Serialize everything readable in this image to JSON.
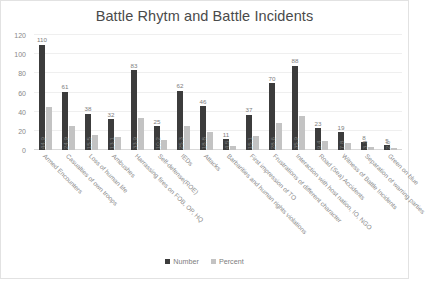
{
  "chart_data": {
    "type": "bar",
    "title": "Battle Rhytm and Battle Incidents",
    "xlabel": "",
    "ylabel": "",
    "ylim": [
      0,
      120
    ],
    "yticks": [
      0,
      20,
      40,
      60,
      80,
      100,
      120
    ],
    "grid": true,
    "legend_position": "bottom",
    "categories": [
      "Armed Encounters",
      "Casualties of own troops",
      "Loss of human life",
      "Ambushes",
      "Harrassing fires on FOB, OP, HQ",
      "Self-defense(ROE)",
      "IEDs",
      "Attacks",
      "Barbarities and human rights violations",
      "First impression of TO",
      "Frustrations of different character",
      "Interaction with host nation, IO, NGO",
      "Road (Sea) Accidents",
      "Witness of Battle Incidents",
      "Separation of warring parties",
      "Green on blue"
    ],
    "series": [
      {
        "name": "Number",
        "color": "#3c3c3c",
        "values": [
          110,
          61,
          38,
          32,
          83,
          25,
          62,
          46,
          11,
          37,
          70,
          88,
          23,
          19,
          8,
          5
        ],
        "labels": [
          "110",
          "61",
          "38",
          "32",
          "83",
          "25",
          "62",
          "46",
          "11",
          "37",
          "70",
          "88",
          "23",
          "19",
          "8",
          "5"
        ]
      },
      {
        "name": "Percent",
        "color": "#c3c3c3",
        "values": [
          44.9,
          24.9,
          15.5,
          13.1,
          33.9,
          10.2,
          25.3,
          18.8,
          4.5,
          15.1,
          28.6,
          35.9,
          9.4,
          7.8,
          3.3,
          2.0
        ],
        "labels": [
          "44.9",
          "24.9",
          "15.5",
          "13.1",
          "33.9",
          "10.2",
          "25.3",
          "18.8",
          "4.5",
          "15.1",
          "28.6",
          "35.9",
          "9.4",
          "7.8",
          "3.3",
          "2.0"
        ]
      }
    ]
  },
  "legend": {
    "items": [
      {
        "label": "Number"
      },
      {
        "label": "Percent"
      }
    ]
  }
}
